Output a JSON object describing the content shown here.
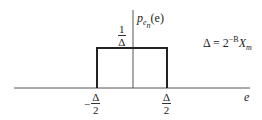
{
  "diagram": {
    "y_label": {
      "p": "p",
      "sub": "e",
      "subsub": "n",
      "arg": "(e)"
    },
    "x_label": "e",
    "height_label": {
      "num": "1",
      "den": "Δ"
    },
    "left_tick": {
      "sign": "−",
      "num": "Δ",
      "den": "2"
    },
    "right_tick": {
      "num": "Δ",
      "den": "2"
    },
    "equation": {
      "lhs": "Δ = 2",
      "exp": "−B",
      "var": "X",
      "sub": "m"
    },
    "colors": {
      "line": "#333333",
      "rect": "#222222",
      "background": "#ffffff"
    }
  }
}
